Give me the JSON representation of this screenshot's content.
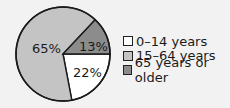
{
  "chart_data": {
    "type": "pie",
    "title": "",
    "categories": [
      "0–14 years",
      "15–64 years",
      "65 years or older"
    ],
    "values": [
      22,
      65,
      13
    ],
    "labels": [
      "22%",
      "65%",
      "13%"
    ],
    "colors": [
      "#ffffff",
      "#c4c4c4",
      "#8c8c8c"
    ],
    "legend_position": "right"
  },
  "legend": {
    "items": [
      {
        "label": "0–14 years",
        "color": "#ffffff"
      },
      {
        "label": "15–64 years",
        "color": "#c4c4c4"
      },
      {
        "label": "65 years or older",
        "color": "#8c8c8c"
      }
    ]
  }
}
